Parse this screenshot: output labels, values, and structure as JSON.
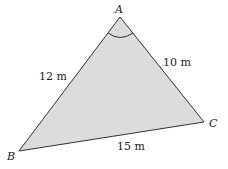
{
  "figure": {
    "type": "triangle",
    "fill_color": "#dcdcdc",
    "stroke_color": "#333333",
    "vertices": {
      "A": {
        "label": "A",
        "x": 120,
        "y": 17
      },
      "B": {
        "label": "B",
        "x": 19,
        "y": 151
      },
      "C": {
        "label": "C",
        "x": 204,
        "y": 122
      }
    },
    "sides": {
      "AB": {
        "label": "12 m"
      },
      "AC": {
        "label": "10 m"
      },
      "BC": {
        "label": "15 m"
      }
    },
    "angle_marker": {
      "at": "A"
    }
  }
}
